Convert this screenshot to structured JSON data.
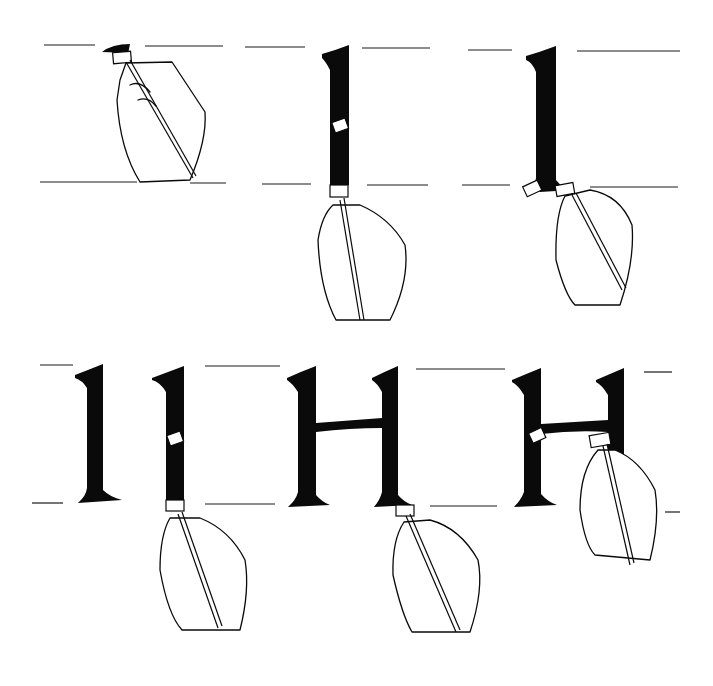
{
  "illustration": {
    "subject": "calligraphy stroke sequence for letter H",
    "background": "#ffffff",
    "ink_color": "#0a0a0a",
    "rows": [
      {
        "name": "row-1",
        "panels": [
          {
            "step": 1,
            "description": "pen nib placed at top with small entry stroke"
          },
          {
            "step": 2,
            "description": "vertical stem drawn downward, pen at base"
          },
          {
            "step": 3,
            "description": "foot serif finished at baseline"
          }
        ]
      },
      {
        "name": "row-2",
        "panels": [
          {
            "step": 4,
            "description": "completed first stem"
          },
          {
            "step": 5,
            "description": "second stem drawn downward"
          },
          {
            "step": 6,
            "description": "crossbar added between stems"
          },
          {
            "step": 7,
            "description": "pen positioned on crossbar"
          }
        ]
      }
    ]
  }
}
